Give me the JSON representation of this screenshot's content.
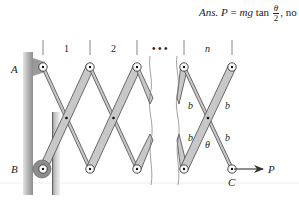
{
  "answer": {
    "prefix": "Ans.",
    "lhs": "P",
    "equals": "=",
    "mg": "mg",
    "func": "tan",
    "numerator": "θ",
    "denominator": "2",
    "suffix": ", no"
  },
  "diagram": {
    "bay_labels": [
      "1",
      "2",
      "• • •",
      "n"
    ],
    "point_labels": {
      "A": "A",
      "B": "B",
      "C": "C"
    },
    "member_labels": {
      "b1": "b",
      "b2": "b",
      "b3": "b",
      "b4": "b"
    },
    "angle_label": "θ",
    "force_label": "P",
    "colors": {
      "member_fill": "#c8c8c8",
      "member_stroke": "#4a4a4a",
      "wall": "#b9b9b9",
      "wall_dark": "#8a8a8a",
      "text": "#222222",
      "roller": "#8c8c8c"
    }
  }
}
